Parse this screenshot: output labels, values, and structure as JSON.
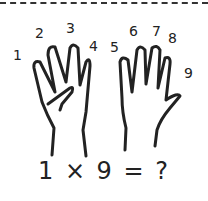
{
  "figure": {
    "finger_labels": [
      "1",
      "2",
      "3",
      "4",
      "5",
      "6",
      "7",
      "8",
      "9"
    ],
    "equation": "1 × 9 = ?",
    "stroke_color": "#222222",
    "border": "dashed-top"
  }
}
